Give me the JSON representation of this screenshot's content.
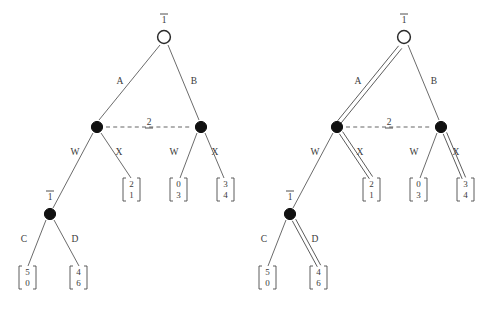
{
  "figure": {
    "background_color": "#ffffff",
    "line_color": "#5a5a5a",
    "text_color": "#3a3a3a",
    "node_open_fill": "#ffffff",
    "node_filled_fill": "#111111"
  },
  "trees": [
    {
      "id": "left-tree",
      "name": "left-game-tree",
      "highlighted_edges": [],
      "nodes": [
        {
          "id": "root",
          "type": "open",
          "label": "1",
          "label_style": "overline",
          "x": 160,
          "y": 37
        },
        {
          "id": "n-left",
          "type": "filled",
          "label": "",
          "label_style": "none",
          "x": 97,
          "y": 127
        },
        {
          "id": "n-right",
          "type": "filled",
          "label": "",
          "label_style": "none",
          "x": 201,
          "y": 127
        },
        {
          "id": "n-lower",
          "type": "filled",
          "label": "1",
          "label_style": "overline",
          "x": 50,
          "y": 214
        }
      ],
      "edges": [
        {
          "id": "e-A",
          "label": "A",
          "from": "root",
          "to": "n-left",
          "highlighted": false
        },
        {
          "id": "e-B",
          "label": "B",
          "from": "root",
          "to": "n-right",
          "highlighted": false
        },
        {
          "id": "e-W1",
          "label": "W",
          "from": "n-left",
          "to": "n-lower",
          "highlighted": false
        },
        {
          "id": "e-X1",
          "label": "X",
          "from": "n-left",
          "to": "v-21",
          "highlighted": false
        },
        {
          "id": "e-W2",
          "label": "W",
          "from": "n-right",
          "to": "v-03",
          "highlighted": false
        },
        {
          "id": "e-X2",
          "label": "X",
          "from": "n-right",
          "to": "v-34",
          "highlighted": false
        },
        {
          "id": "e-C",
          "label": "C",
          "from": "n-lower",
          "to": "v-50",
          "highlighted": false
        },
        {
          "id": "e-D",
          "label": "D",
          "from": "n-lower",
          "to": "v-46",
          "highlighted": false
        }
      ],
      "information_set": {
        "label": "2",
        "label_style": "underline",
        "from": "n-left",
        "to": "n-right"
      },
      "payoffs": [
        {
          "id": "v-21",
          "top": "2",
          "bottom": "1",
          "x": 129,
          "y": 192
        },
        {
          "id": "v-03",
          "top": "0",
          "bottom": "3",
          "x": 176,
          "y": 192
        },
        {
          "id": "v-34",
          "top": "3",
          "bottom": "4",
          "x": 223,
          "y": 192
        },
        {
          "id": "v-50",
          "top": "5",
          "bottom": "0",
          "x": 25,
          "y": 280
        },
        {
          "id": "v-46",
          "top": "4",
          "bottom": "6",
          "x": 76,
          "y": 280
        }
      ]
    },
    {
      "id": "right-tree",
      "name": "right-game-tree",
      "highlighted_edges": [
        "e-A",
        "e-X1",
        "e-X2",
        "e-D"
      ],
      "nodes": [
        {
          "id": "root",
          "type": "open",
          "label": "1",
          "label_style": "overline",
          "x": 160,
          "y": 37
        },
        {
          "id": "n-left",
          "type": "filled",
          "label": "",
          "label_style": "none",
          "x": 97,
          "y": 127
        },
        {
          "id": "n-right",
          "type": "filled",
          "label": "",
          "label_style": "none",
          "x": 201,
          "y": 127
        },
        {
          "id": "n-lower",
          "type": "filled",
          "label": "1",
          "label_style": "overline",
          "x": 50,
          "y": 214
        }
      ],
      "edges": [
        {
          "id": "e-A",
          "label": "A",
          "from": "root",
          "to": "n-left",
          "highlighted": true
        },
        {
          "id": "e-B",
          "label": "B",
          "from": "root",
          "to": "n-right",
          "highlighted": false
        },
        {
          "id": "e-W1",
          "label": "W",
          "from": "n-left",
          "to": "n-lower",
          "highlighted": false
        },
        {
          "id": "e-X1",
          "label": "X",
          "from": "n-left",
          "to": "v-21",
          "highlighted": true
        },
        {
          "id": "e-W2",
          "label": "W",
          "from": "n-right",
          "to": "v-03",
          "highlighted": false
        },
        {
          "id": "e-X2",
          "label": "X",
          "from": "n-right",
          "to": "v-34",
          "highlighted": true
        },
        {
          "id": "e-C",
          "label": "C",
          "from": "n-lower",
          "to": "v-50",
          "highlighted": false
        },
        {
          "id": "e-D",
          "label": "D",
          "from": "n-lower",
          "to": "v-46",
          "highlighted": true
        }
      ],
      "information_set": {
        "label": "2",
        "label_style": "underline",
        "from": "n-left",
        "to": "n-right"
      },
      "payoffs": [
        {
          "id": "v-21",
          "top": "2",
          "bottom": "1",
          "x": 129,
          "y": 192
        },
        {
          "id": "v-03",
          "top": "0",
          "bottom": "3",
          "x": 176,
          "y": 192
        },
        {
          "id": "v-34",
          "top": "3",
          "bottom": "4",
          "x": 223,
          "y": 192
        },
        {
          "id": "v-50",
          "top": "5",
          "bottom": "0",
          "x": 25,
          "y": 280
        },
        {
          "id": "v-46",
          "top": "4",
          "bottom": "6",
          "x": 76,
          "y": 280
        }
      ]
    }
  ],
  "labels": {
    "root_player": "1",
    "lower_player": "1",
    "infoset_player": "2",
    "action_A": "A",
    "action_B": "B",
    "action_W": "W",
    "action_X": "X",
    "action_C": "C",
    "action_D": "D"
  }
}
